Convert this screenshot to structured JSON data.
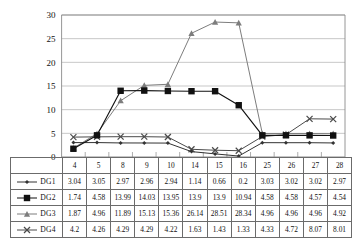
{
  "chart_data": {
    "type": "line",
    "title": "",
    "xlabel": "",
    "ylabel": "",
    "categories": [
      "4",
      "5",
      "8",
      "9",
      "10",
      "14",
      "15",
      "16",
      "25",
      "26",
      "27",
      "28"
    ],
    "ylim": [
      0,
      30
    ],
    "yticks": [
      "0",
      "5",
      "10",
      "15",
      "20",
      "25",
      "30"
    ],
    "grid": true,
    "legend_position": "table-left",
    "series": [
      {
        "name": "DG1",
        "marker": "diamond-icon",
        "color": "#333333",
        "values": [
          3.04,
          3.05,
          2.97,
          2.96,
          2.94,
          1.14,
          0.66,
          0.2,
          3.03,
          3.02,
          3.02,
          2.97
        ],
        "labels": [
          "3.04",
          "3.05",
          "2.97",
          "2.96",
          "2.94",
          "1.14",
          "0.66",
          "0.2",
          "3.03",
          "3.02",
          "3.02",
          "2.97"
        ]
      },
      {
        "name": "DG2",
        "marker": "square-icon",
        "color": "#111111",
        "values": [
          1.74,
          4.58,
          13.99,
          14.03,
          13.95,
          13.9,
          13.9,
          10.94,
          4.58,
          4.58,
          4.57,
          4.54
        ],
        "labels": [
          "1.74",
          "4.58",
          "13.99",
          "14.03",
          "13.95",
          "13.9",
          "13.9",
          "10.94",
          "4.58",
          "4.58",
          "4.57",
          "4.54"
        ]
      },
      {
        "name": "DG3",
        "marker": "triangle-icon",
        "color": "#7d7d7d",
        "values": [
          1.87,
          4.96,
          11.89,
          15.13,
          15.36,
          26.14,
          28.51,
          28.34,
          4.96,
          4.96,
          4.96,
          4.92
        ],
        "labels": [
          "1.87",
          "4.96",
          "11.89",
          "15.13",
          "15.36",
          "26.14",
          "28.51",
          "28.34",
          "4.96",
          "4.96",
          "4.96",
          "4.92"
        ]
      },
      {
        "name": "DG4",
        "marker": "cross-icon",
        "color": "#4a4a4a",
        "values": [
          4.2,
          4.26,
          4.29,
          4.29,
          4.22,
          1.63,
          1.43,
          1.33,
          4.33,
          4.72,
          8.07,
          8.01
        ],
        "labels": [
          "4.2",
          "4.26",
          "4.29",
          "4.29",
          "4.22",
          "1.63",
          "1.43",
          "1.33",
          "4.33",
          "4.72",
          "8.07",
          "8.01"
        ]
      }
    ]
  },
  "colors": {
    "grid": "#b9b9b9",
    "axis": "#8a8a8a",
    "table_border": "#6b6b6b",
    "text": "#111111"
  }
}
